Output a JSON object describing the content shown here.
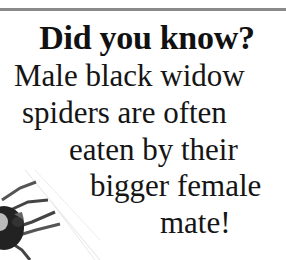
{
  "fact_card": {
    "heading": "Did you know?",
    "lines": [
      "Male black widow",
      "spiders are often",
      "eaten by their",
      "bigger female",
      "mate!"
    ],
    "image": "black-widow-spider-illustration",
    "rule_color": "#8a8a8a"
  }
}
